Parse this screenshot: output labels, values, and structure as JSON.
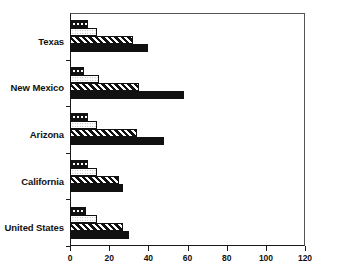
{
  "chart_data": {
    "type": "bar",
    "orientation": "horizontal",
    "title": "",
    "xlabel": "",
    "ylabel": "",
    "grid": false,
    "legend": "none",
    "xlim": [
      0,
      120
    ],
    "xticks": [
      0,
      20,
      40,
      60,
      80,
      100,
      120
    ],
    "xtick_labels": [
      "0",
      "20",
      "40",
      "60",
      "80",
      "100",
      "120"
    ],
    "categories": [
      "Texas",
      "New Mexico",
      "Arizona",
      "California",
      "United States"
    ],
    "series": [
      {
        "name": "series-1",
        "pattern": "dark-with-white-dots",
        "values": [
          9,
          7,
          9,
          9,
          8
        ]
      },
      {
        "name": "series-2",
        "pattern": "light-stipple",
        "values": [
          14,
          15,
          14,
          14,
          14
        ]
      },
      {
        "name": "series-3",
        "pattern": "diagonal-hatch",
        "values": [
          32,
          35,
          34,
          25,
          27
        ]
      },
      {
        "name": "series-4",
        "pattern": "solid-black",
        "values": [
          40,
          58,
          48,
          27,
          30
        ]
      }
    ],
    "colors": {
      "axis": "#1a1a1a",
      "bar_outline": "#111111",
      "fill_dark": "#111111",
      "fill_light": "#ffffff",
      "background": "#ffffff"
    }
  }
}
